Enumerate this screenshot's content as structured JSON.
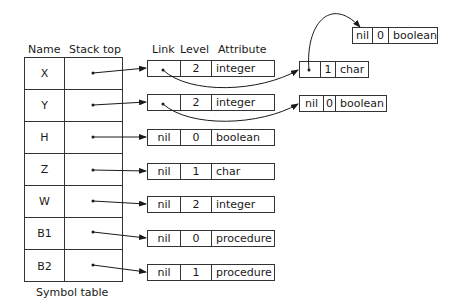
{
  "headers": {
    "name": "Name",
    "stack_top": "Stack top",
    "link": "Link",
    "level": "Level",
    "attribute": "Attribute"
  },
  "symbol_table": {
    "caption": "Symbol table",
    "rows": [
      {
        "name": "X"
      },
      {
        "name": "Y"
      },
      {
        "name": "H"
      },
      {
        "name": "Z"
      },
      {
        "name": "W"
      },
      {
        "name": "B1"
      },
      {
        "name": "B2"
      }
    ]
  },
  "records": {
    "x_top": {
      "link": "",
      "level": "2",
      "attribute": "integer"
    },
    "y_top": {
      "link": "",
      "level": "2",
      "attribute": "integer"
    },
    "h": {
      "link": "nil",
      "level": "0",
      "attribute": "boolean"
    },
    "z": {
      "link": "nil",
      "level": "1",
      "attribute": "char"
    },
    "w": {
      "link": "nil",
      "level": "2",
      "attribute": "integer"
    },
    "b1": {
      "link": "nil",
      "level": "0",
      "attribute": "procedure"
    },
    "b2": {
      "link": "nil",
      "level": "1",
      "attribute": "procedure"
    },
    "x_mid": {
      "link": "",
      "level": "1",
      "attribute": "char"
    },
    "x_bottom": {
      "link": "nil",
      "level": "0",
      "attribute": "boolean"
    },
    "y_bottom": {
      "link": "nil",
      "level": "0",
      "attribute": "boolean"
    }
  }
}
